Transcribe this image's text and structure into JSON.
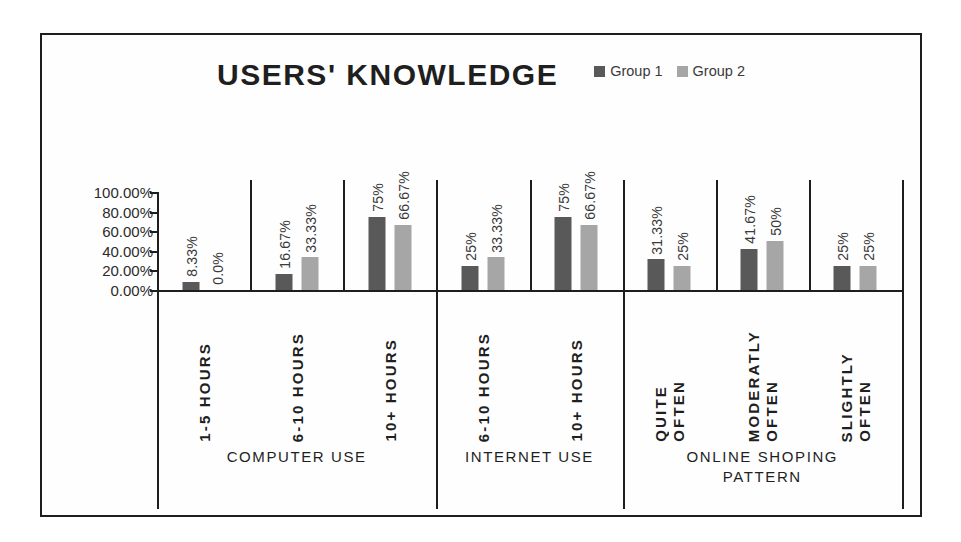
{
  "chart_data": {
    "type": "bar",
    "title": "USERS' KNOWLEDGE",
    "xlabel": "",
    "ylabel": "",
    "ylim": [
      0,
      100
    ],
    "grid": false,
    "legend_position": "top-right",
    "y_ticks": [
      "0.00%",
      "20.00%",
      "40.00%",
      "60.00%",
      "80.00%",
      "100.00%"
    ],
    "y_tick_values": [
      0,
      20,
      40,
      60,
      80,
      100
    ],
    "categories": [
      "1-5 HOURS",
      "6-10 HOURS",
      "10+ HOURS",
      "6-10 HOURS",
      "10+ HOURS",
      "QUITE OFTEN",
      "MODERATLY OFTEN",
      "SLIGHTLY OFTEN"
    ],
    "category_lines": [
      [
        "1-5 HOURS"
      ],
      [
        "6-10 HOURS"
      ],
      [
        "10+ HOURS"
      ],
      [
        "6-10 HOURS"
      ],
      [
        "10+ HOURS"
      ],
      [
        "QUITE",
        "OFTEN"
      ],
      [
        "MODERATLY",
        "OFTEN"
      ],
      [
        "SLIGHTLY",
        "OFTEN"
      ]
    ],
    "series": [
      {
        "name": "Group 1",
        "color": "#595959",
        "values": [
          8.33,
          16.67,
          75,
          25,
          75,
          31.33,
          41.67,
          25
        ],
        "labels": [
          "8.33%",
          "16.67%",
          "75%",
          "25%",
          "75%",
          "31.33%",
          "41.67%",
          "25%"
        ]
      },
      {
        "name": "Group 2",
        "color": "#a6a6a6",
        "values": [
          0.0,
          33.33,
          66.67,
          33.33,
          66.67,
          25,
          50,
          25
        ],
        "labels": [
          "0.0%",
          "33.33%",
          "66.67%",
          "33.33%",
          "66.67%",
          "25%",
          "50%",
          "25%"
        ]
      }
    ],
    "groups": [
      {
        "label": "COMPUTER USE",
        "lines": [
          "COMPUTER USE"
        ],
        "category_count": 3
      },
      {
        "label": "INTERNET USE",
        "lines": [
          "INTERNET USE"
        ],
        "category_count": 2
      },
      {
        "label": "ONLINE SHOPING PATTERN",
        "lines": [
          "ONLINE SHOPING",
          "PATTERN"
        ],
        "category_count": 3
      }
    ]
  },
  "legend": {
    "items": [
      {
        "label": "Group 1",
        "color": "#595959"
      },
      {
        "label": "Group 2",
        "color": "#a6a6a6"
      }
    ]
  },
  "colors": {
    "group1": "#595959",
    "group2": "#a6a6a6",
    "axis": "#1e1e1e",
    "frame": "#1e1e1e",
    "background": "#ffffff",
    "text": "#2b2b2b"
  }
}
